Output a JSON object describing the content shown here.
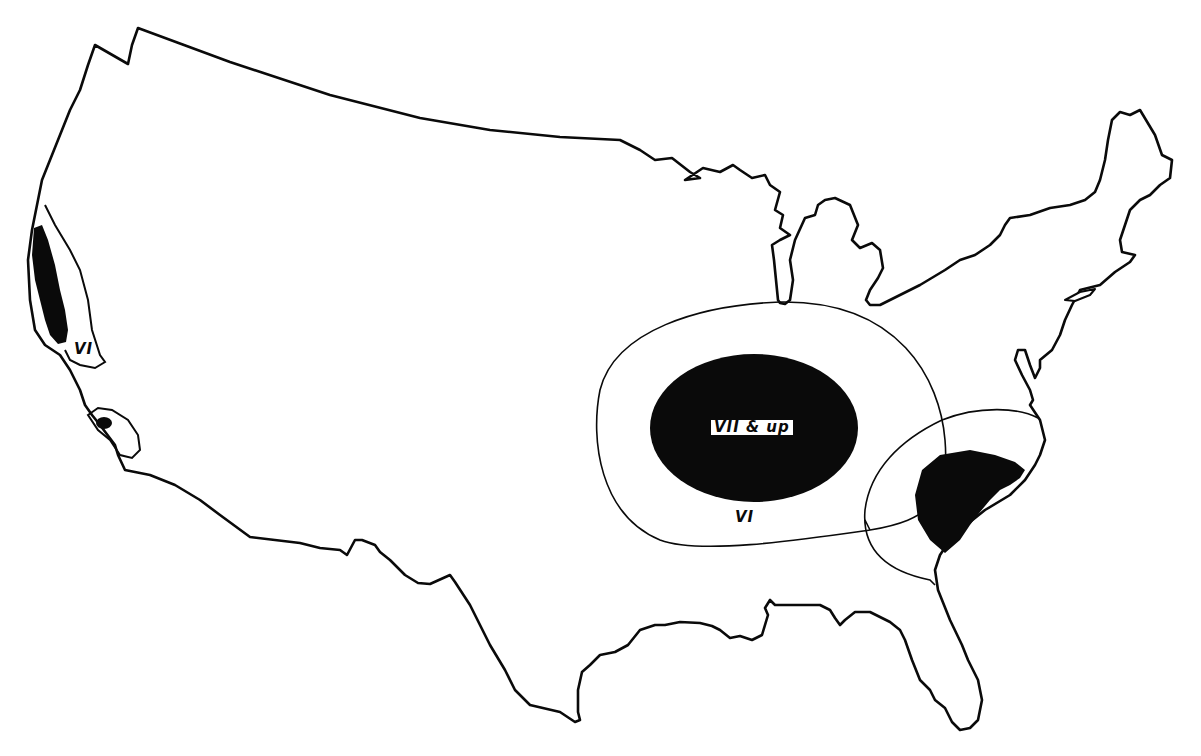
{
  "map": {
    "type": "isoseismal-map",
    "region": "Contiguous United States",
    "colors": {
      "background": "#ffffff",
      "outline": "#0a0a0a",
      "intensity_vii_fill": "#0a0a0a"
    }
  },
  "zones": [
    {
      "id": "central-east",
      "intensity_label": "VII & up",
      "style": "filled-black",
      "region": "central (lower Ohio / Mississippi valley)"
    },
    {
      "id": "central-east-outer",
      "intensity_label": "VI",
      "style": "outline",
      "region": "surrounding central zone"
    },
    {
      "id": "southeast",
      "intensity_label": "",
      "style": "filled-black with outline ring",
      "region": "South Carolina area"
    },
    {
      "id": "california-north",
      "intensity_label": "VI",
      "style": "filled-black coastal strip with outline",
      "region": "northern California coast"
    },
    {
      "id": "california-south",
      "intensity_label": "",
      "style": "small filled-black spot with outline",
      "region": "southern California"
    }
  ],
  "labels": {
    "central_high": "VII & up",
    "central_outer": "VI",
    "california_outer": "VI"
  }
}
